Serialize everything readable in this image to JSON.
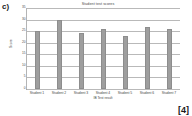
{
  "question": {
    "label": "c)",
    "marks": "[4]"
  },
  "chart_data": {
    "type": "bar",
    "title": "Student test scores",
    "xlabel": "IB Test result",
    "ylabel": "Score",
    "categories": [
      "Student 1",
      "Student 2",
      "Student 3",
      "Student 4",
      "Student 5",
      "Student 6",
      "Student 7"
    ],
    "values": [
      25,
      30,
      24,
      26,
      23,
      27,
      26
    ],
    "ylim": [
      0,
      35
    ],
    "ytick_labels": [
      "0",
      "5",
      "10",
      "15",
      "20",
      "25",
      "30",
      "35"
    ],
    "ytick_values": [
      0,
      5,
      10,
      15,
      20,
      25,
      30,
      35
    ],
    "grid": true,
    "legend": false,
    "series_color": "#9e9e9e"
  }
}
